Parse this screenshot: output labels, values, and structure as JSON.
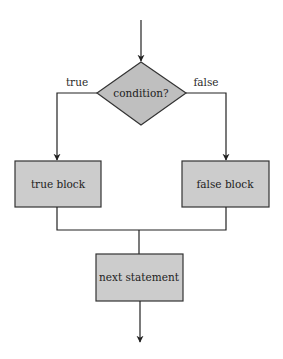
{
  "diagram": {
    "type": "flowchart",
    "colors": {
      "box_fill": "#cccccc",
      "diamond_fill": "#bfbfbf",
      "stroke": "#222222",
      "background": "#ffffff"
    },
    "nodes": {
      "condition": {
        "shape": "diamond",
        "label": "condition?"
      },
      "true_block": {
        "shape": "rectangle",
        "label": "true block"
      },
      "false_block": {
        "shape": "rectangle",
        "label": "false block"
      },
      "next_statement": {
        "shape": "rectangle",
        "label": "next statement"
      }
    },
    "edges": {
      "entry": {
        "from": "start",
        "to": "condition",
        "label": ""
      },
      "true_branch": {
        "from": "condition",
        "to": "true_block",
        "label": "true"
      },
      "false_branch": {
        "from": "condition",
        "to": "false_block",
        "label": "false"
      },
      "true_merge": {
        "from": "true_block",
        "to": "next_statement",
        "label": ""
      },
      "false_merge": {
        "from": "false_block",
        "to": "next_statement",
        "label": ""
      },
      "exit": {
        "from": "next_statement",
        "to": "end",
        "label": ""
      }
    }
  }
}
